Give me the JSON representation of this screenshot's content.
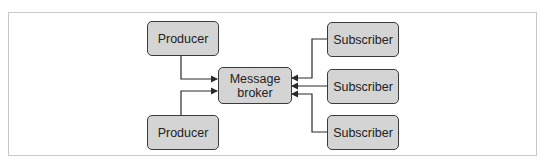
{
  "diagram": {
    "producers": [
      {
        "label": "Producer"
      },
      {
        "label": "Producer"
      }
    ],
    "broker": {
      "label_line1": "Message",
      "label_line2": "broker"
    },
    "subscribers": [
      {
        "label": "Subscriber"
      },
      {
        "label": "Subscriber"
      },
      {
        "label": "Subscriber"
      }
    ]
  },
  "colors": {
    "node_fill": "#d4d4d4",
    "node_border": "#3a3a3a",
    "line": "#2a2a2a",
    "frame": "#c8c8c8"
  }
}
